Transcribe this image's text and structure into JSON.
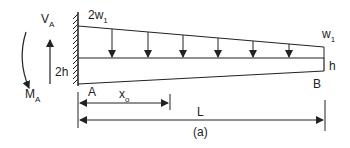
{
  "diagram": {
    "caption": "(a)",
    "labels": {
      "shear": {
        "main": "V",
        "sub": "A"
      },
      "moment": {
        "main": "M",
        "sub": "A"
      },
      "load_left": {
        "main": "2w",
        "sub": "1"
      },
      "load_right": {
        "main": "w",
        "sub": "1"
      },
      "depth_left": "2h",
      "depth_right": "h",
      "point_a": "A",
      "point_b": "B",
      "dim_x0": {
        "main": "x",
        "sub": "o"
      },
      "dim_L": "L"
    },
    "colors": {
      "stroke": "#222222",
      "background": "#ffffff"
    },
    "load_arrow_count": 6
  }
}
